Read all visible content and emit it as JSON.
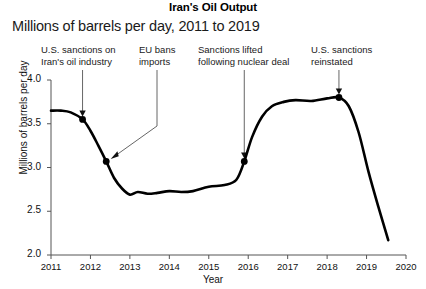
{
  "chart_data": {
    "type": "line",
    "title": "Iran's Oil Output",
    "subtitle": "Millions of barrels per day, 2011 to 2019",
    "xlabel": "Year",
    "ylabel": "Millions of barrels per day",
    "xlim": [
      2011,
      2020
    ],
    "ylim": [
      2.0,
      4.0
    ],
    "grid": false,
    "legend": "none",
    "xticks": [
      "2011",
      "2012",
      "2013",
      "2014",
      "2015",
      "2016",
      "2017",
      "2018",
      "2019",
      "2020"
    ],
    "yticks": [
      "2.0",
      "2.5",
      "3.0",
      "3.5",
      "4.0"
    ],
    "series": [
      {
        "name": "Iran crude oil production",
        "x": [
          2011.0,
          2011.25,
          2011.5,
          2011.8,
          2012.0,
          2012.2,
          2012.4,
          2012.6,
          2012.8,
          2013.0,
          2013.2,
          2013.45,
          2013.7,
          2014.0,
          2014.3,
          2014.6,
          2015.0,
          2015.4,
          2015.7,
          2015.9,
          2016.1,
          2016.35,
          2016.6,
          2016.9,
          2017.2,
          2017.6,
          2018.0,
          2018.3,
          2018.55,
          2018.8,
          2019.05,
          2019.3,
          2019.55
        ],
        "values": [
          3.65,
          3.65,
          3.63,
          3.55,
          3.42,
          3.25,
          3.07,
          2.88,
          2.76,
          2.69,
          2.72,
          2.7,
          2.71,
          2.73,
          2.72,
          2.73,
          2.78,
          2.8,
          2.86,
          3.07,
          3.35,
          3.58,
          3.7,
          3.75,
          3.77,
          3.76,
          3.79,
          3.8,
          3.7,
          3.4,
          2.95,
          2.55,
          2.17
        ]
      }
    ],
    "markers": [
      {
        "label": "sanctions-marker-1",
        "x": 2011.8,
        "y": 3.55
      },
      {
        "label": "sanctions-marker-2",
        "x": 2012.4,
        "y": 3.07
      },
      {
        "label": "sanctions-marker-3",
        "x": 2015.9,
        "y": 3.07
      },
      {
        "label": "sanctions-marker-4",
        "x": 2018.3,
        "y": 3.8
      }
    ],
    "annotations": [
      {
        "id": "us-sanctions-oil-industry",
        "line1": "U.S. sanctions on",
        "line2": "Iran's oil industry",
        "target_x": 2011.8,
        "target_y": 3.55,
        "connector": "arrow-down"
      },
      {
        "id": "eu-bans-imports",
        "line1": "EU bans",
        "line2": "imports",
        "target_x": 2012.4,
        "target_y": 3.07,
        "connector": "elbow-arrow-left"
      },
      {
        "id": "sanctions-lifted-nuclear-deal",
        "line1": "Sanctions lifted",
        "line2": "following nuclear deal",
        "target_x": 2015.9,
        "target_y": 3.07,
        "connector": "arrow-down"
      },
      {
        "id": "us-sanctions-reinstated",
        "line1": "U.S. sanctions",
        "line2": "reinstated",
        "target_x": 2018.3,
        "target_y": 3.8,
        "connector": "arrow-down"
      }
    ],
    "colors": {
      "line": "#000000",
      "axis": "#555555",
      "text": "#111111",
      "background": "#ffffff",
      "annotation_leader": "#666666"
    }
  }
}
